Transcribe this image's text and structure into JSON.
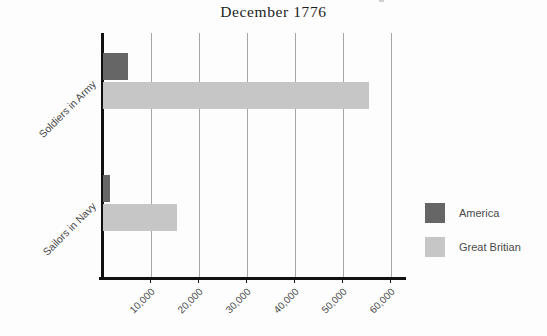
{
  "chart_data": {
    "type": "bar",
    "orientation": "horizontal",
    "title": "December 1776",
    "xlabel": "",
    "ylabel": "",
    "categories": [
      "Soldiers in Army",
      "Sailors in Navy"
    ],
    "series": [
      {
        "name": "America",
        "color": "#666666",
        "values": [
          5200,
          1500
        ]
      },
      {
        "name": "Great Britian",
        "color": "#c6c6c6",
        "values": [
          55500,
          15500
        ]
      }
    ],
    "xlim": [
      0,
      63000
    ],
    "xticks": [
      10000,
      20000,
      30000,
      40000,
      50000,
      60000
    ],
    "xtick_labels": [
      "10,000",
      "20,000",
      "30,000",
      "40,000",
      "50,000",
      "60,000"
    ],
    "grid": "vertical",
    "legend_position": "right"
  },
  "legend": {
    "items": [
      {
        "label": "America",
        "color": "#666666"
      },
      {
        "label": "Great Britian",
        "color": "#c6c6c6"
      }
    ]
  },
  "colors": {
    "america": "#666666",
    "britain": "#c6c6c6",
    "axis": "#111111",
    "grid": "#6f6f6f",
    "background": "#fdfdfd",
    "text": "#4a4a4a"
  }
}
